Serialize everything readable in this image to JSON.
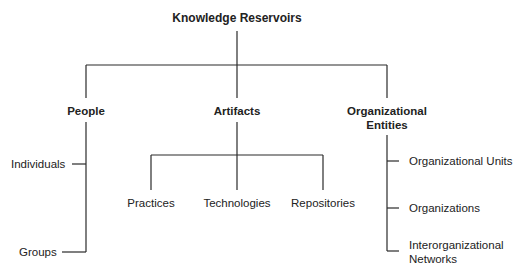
{
  "diagram": {
    "root": "Knowledge Reservoirs",
    "categories": [
      {
        "label": "People",
        "children": [
          "Individuals",
          "Groups"
        ]
      },
      {
        "label": "Artifacts",
        "children": [
          "Practices",
          "Technologies",
          "Repositories"
        ]
      },
      {
        "label_line1": "Organizational",
        "label_line2": "Entities",
        "children": [
          "Organizational Units",
          "Organizations",
          "Interorganizational",
          "Networks"
        ]
      }
    ]
  }
}
